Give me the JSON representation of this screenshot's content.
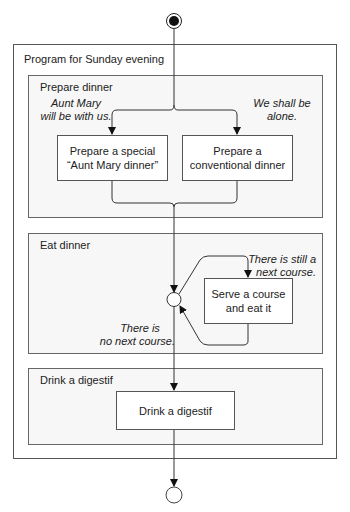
{
  "diagram": {
    "type": "UML activity diagram",
    "outer_activity": {
      "title": "Program for Sunday evening"
    },
    "regions": [
      {
        "title": "Prepare dinner"
      },
      {
        "title": "Eat dinner"
      },
      {
        "title": "Drink a digestif"
      }
    ],
    "actions": {
      "aunt_mary_dinner": {
        "line1": "Prepare a special",
        "line2": "“Aunt Mary dinner”"
      },
      "conventional_dinner": {
        "line1": "Prepare a",
        "line2": "conventional dinner"
      },
      "serve_course": {
        "line1": "Serve a course",
        "line2": "and eat it"
      },
      "drink_digestif": {
        "line1": "Drink a digestif"
      }
    },
    "guards": {
      "aunt_mary": {
        "line1": "Aunt Mary",
        "line2": "will be with us."
      },
      "alone": {
        "line1": "We shall be",
        "line2": "alone."
      },
      "next_course": {
        "line1": "There is still a",
        "line2": "next course."
      },
      "no_next_course": {
        "line1": "There is",
        "line2": "no next course."
      }
    },
    "nodes": {
      "initial": "initial-node",
      "merge": "merge-node",
      "final": "final-node"
    }
  }
}
